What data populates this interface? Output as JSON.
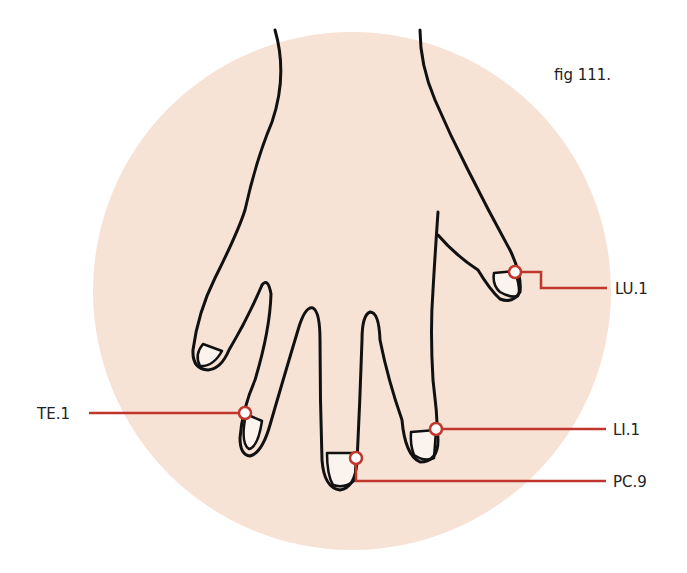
{
  "figure": {
    "caption": "fig 111.",
    "background_circle_color": "#f7e2d6",
    "outline_color": "#111111",
    "marker_color": "#c0362c",
    "nail_color": "#fbf3ee"
  },
  "points": [
    {
      "id": "LU.1",
      "label": "LU.1",
      "location": "thumb nail, radial corner"
    },
    {
      "id": "TE.1",
      "label": "TE.1",
      "location": "ring finger nail, ulnar corner"
    },
    {
      "id": "LI.1",
      "label": "LI.1",
      "location": "index finger nail, radial corner"
    },
    {
      "id": "PC.9",
      "label": "PC.9",
      "location": "middle finger tip"
    }
  ]
}
